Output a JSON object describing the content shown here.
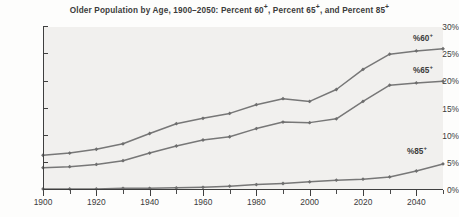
{
  "chart_data": {
    "type": "line",
    "xlabel": "",
    "ylabel": "",
    "xlim": [
      1900,
      2050
    ],
    "ylim": [
      0,
      30
    ],
    "grid": false,
    "legend_position": "inline-right",
    "x": [
      1900,
      1910,
      1920,
      1930,
      1940,
      1950,
      1960,
      1970,
      1980,
      1990,
      2000,
      2010,
      2020,
      2030,
      2040,
      2050
    ],
    "x_tick_labels": [
      "1900",
      "1920",
      "1940",
      "1960",
      "1980",
      "2000",
      "2020",
      "2040"
    ],
    "x_tick_values": [
      1900,
      1920,
      1940,
      1960,
      1980,
      2000,
      2020,
      2040
    ],
    "x_minor_tick_values": [
      1910,
      1930,
      1950,
      1970,
      1990,
      2010,
      2030,
      2050
    ],
    "y_tick_labels": [
      "0%",
      "5%",
      "10%",
      "15%",
      "20%",
      "25%",
      "30%"
    ],
    "y_tick_values": [
      0,
      5,
      10,
      15,
      20,
      25,
      30
    ],
    "series": [
      {
        "name": "%60+",
        "label": "%60",
        "label_sup": "+",
        "color": "#777777",
        "values": [
          6.4,
          6.8,
          7.5,
          8.5,
          10.4,
          12.2,
          13.2,
          14.1,
          15.7,
          16.8,
          16.3,
          18.5,
          22.2,
          25.0,
          25.6,
          26.0
        ]
      },
      {
        "name": "%65+",
        "label": "%65",
        "label_sup": "+",
        "color": "#777777",
        "values": [
          4.1,
          4.3,
          4.7,
          5.4,
          6.8,
          8.1,
          9.2,
          9.8,
          11.3,
          12.5,
          12.4,
          13.1,
          16.3,
          19.3,
          19.7,
          20.0
        ]
      },
      {
        "name": "%85+",
        "label": "%85",
        "label_sup": "+",
        "color": "#777777",
        "values": [
          0.2,
          0.2,
          0.2,
          0.3,
          0.3,
          0.4,
          0.5,
          0.7,
          1.0,
          1.2,
          1.5,
          1.8,
          2.0,
          2.4,
          3.5,
          4.8
        ]
      }
    ]
  },
  "title_parts": {
    "a": "Older Population by Age, 1900–2050: Percent 60",
    "sup1": "+",
    "b": ", Percent 65",
    "sup2": "+",
    "c": ", and Percent 85",
    "sup3": "+"
  },
  "colors": {
    "line": "#777777",
    "marker": "#6e6e6e",
    "axis": "#3f3f3f",
    "text": "#3b3b3b",
    "plot_background": "#f1f0ee",
    "page_background": "#fdfdfc"
  }
}
